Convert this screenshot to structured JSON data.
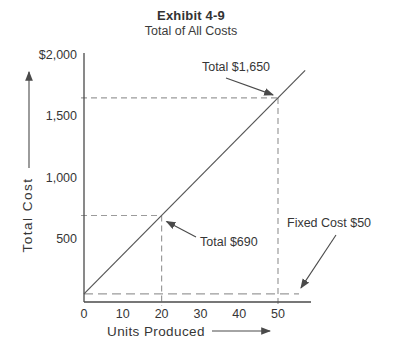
{
  "title": "Exhibit 4-9",
  "subtitle": "Total of All Costs",
  "chart_data": {
    "type": "line",
    "title": "Exhibit 4-9",
    "subtitle": "Total of All Costs",
    "xlabel": "Units Produced",
    "ylabel": "Total Cost",
    "x_tick_labels": [
      "0",
      "10",
      "20",
      "30",
      "40",
      "50"
    ],
    "x_tick_values": [
      0,
      10,
      20,
      30,
      40,
      50
    ],
    "y_tick_labels": [
      "$2,000",
      "1,500",
      "1,000",
      "500"
    ],
    "y_tick_values": [
      2000,
      1500,
      1000,
      500
    ],
    "xlim": [
      0,
      57
    ],
    "ylim": [
      0,
      2000
    ],
    "grid": false,
    "legend": false,
    "series": [
      {
        "name": "total-cost-line",
        "fixed_cost": 50,
        "variable_cost_per_unit": 32,
        "x": [
          0,
          20,
          50
        ],
        "y": [
          50,
          690,
          1650
        ]
      }
    ],
    "annotations": [
      {
        "label": "Total $1,650",
        "x": 50,
        "y": 1650,
        "guides": "both"
      },
      {
        "label": "Total $690",
        "x": 20,
        "y": 690,
        "guides": "both"
      },
      {
        "label": "Fixed Cost $50",
        "y": 50,
        "guides": "horizontal"
      }
    ]
  },
  "colors": {
    "axis": "#4a4a4a",
    "line": "#555555",
    "dashed": "#9b9b9b",
    "text": "#363636"
  }
}
